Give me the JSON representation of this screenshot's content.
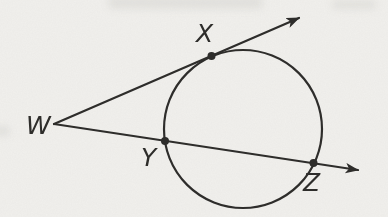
{
  "figure": {
    "ink_color": "#2e2d2b",
    "paper_color": "#f1f0ed",
    "labels": {
      "w": "W",
      "x": "X",
      "y": "Y",
      "z": "Z"
    },
    "geometry": {
      "circle": {
        "cx": 243,
        "cy": 129,
        "r": 79
      },
      "vertex_w": {
        "x": 54,
        "y": 124
      },
      "tangent_ray_tip": {
        "x": 299,
        "y": 18
      },
      "secant_ray_tip": {
        "x": 358,
        "y": 170
      },
      "point_x": {
        "x": 211.5,
        "y": 56
      },
      "point_y": {
        "x": 165,
        "y": 141
      },
      "point_z": {
        "x": 313.5,
        "y": 163
      },
      "dot_radius": 4,
      "label_positions": {
        "w": {
          "x": 26,
          "y": 134
        },
        "x": {
          "x": 196,
          "y": 42
        },
        "y": {
          "x": 141,
          "y": 166
        },
        "z": {
          "x": 303,
          "y": 191
        }
      }
    }
  }
}
